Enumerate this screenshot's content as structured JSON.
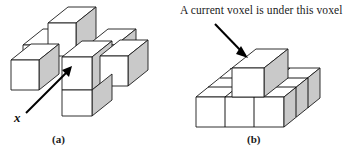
{
  "figure": {
    "panels": [
      {
        "id": "a",
        "caption": "(a)",
        "label": "x",
        "label_role": "current-voxel-pointer",
        "description": "3D cross of voxels with arrow pointing at the center voxel"
      },
      {
        "id": "b",
        "caption": "(b)",
        "annotation": "A current voxel is under this voxel",
        "description": "3x3 voxel slab with one raised voxel at the middle-back cell"
      }
    ]
  },
  "colors": {
    "outline": "#1a1a1a",
    "face_top": "#ffffff",
    "face_front": "#ffffff",
    "face_side": "#c9c9c9",
    "arrow": "#000000",
    "background": "#ffffff",
    "text": "#1a1a1a"
  }
}
